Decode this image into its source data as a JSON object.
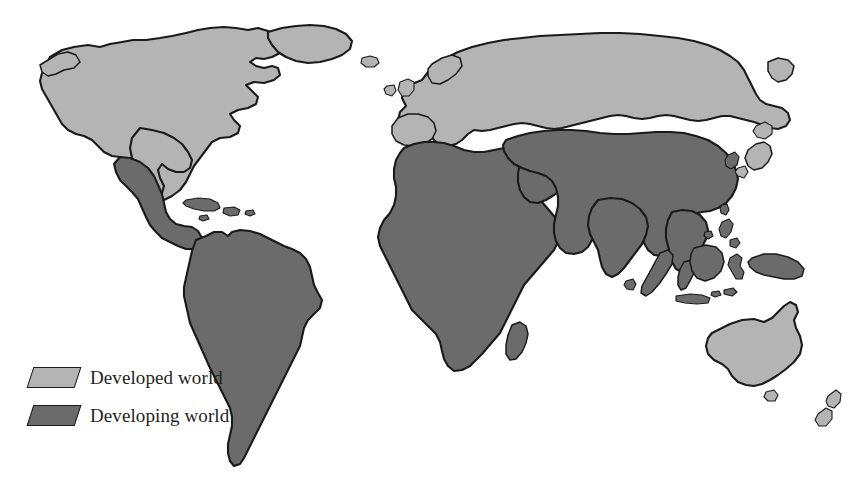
{
  "figure": {
    "background_color": "#ffffff",
    "width": 861,
    "height": 491
  },
  "colors": {
    "developed": "#b4b4b4",
    "developing": "#6b6b6b",
    "outline": "#1a1a1a",
    "background": "#ffffff",
    "label_text": "#1f1f1f"
  },
  "legend": {
    "items": [
      {
        "label": "Developed world",
        "swatch_color": "#b4b4b4",
        "category": "developed"
      },
      {
        "label": "Developing world",
        "swatch_color": "#6b6b6b",
        "category": "developing"
      }
    ]
  },
  "map_data": {
    "type": "choropleth",
    "projection": "equirectangular",
    "classification_scheme": "developed-vs-developing",
    "regions_developed": [
      "United States",
      "Canada",
      "Greenland",
      "Iceland",
      "Western Europe",
      "Northern Europe",
      "Eastern Europe",
      "Russia",
      "Japan",
      "Australia",
      "New Zealand"
    ],
    "regions_developing": [
      "Mexico",
      "Central America",
      "Caribbean",
      "South America",
      "Africa",
      "Madagascar",
      "Middle East",
      "Arabian Peninsula",
      "India",
      "China",
      "Southeast Asia",
      "Indonesia",
      "Papua New Guinea"
    ]
  }
}
